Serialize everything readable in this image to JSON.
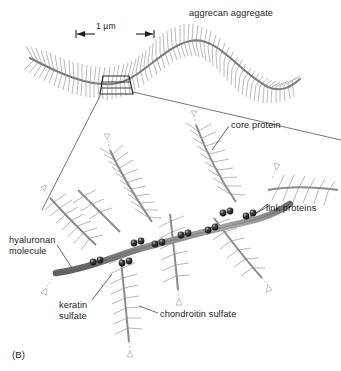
{
  "figure": {
    "panel_letter": "(B)",
    "title": "aggrecan aggregate",
    "scale_bar": {
      "label": "1 µm",
      "kind": "double-headed-arrow"
    },
    "labels": {
      "core_protein": "core protein",
      "link_proteins": "link proteins",
      "hyaluronan_molecule": "hyaluronan\nmolecule",
      "keratin_sulfate": "keratin\nsulfate",
      "chondroitin_sulfate": "chondroitin sulfate"
    },
    "colors": {
      "background": "#ffffff",
      "text": "#1d1d1d",
      "backbone": "#8d8d8d",
      "backbone_edge": "#5e5e5e",
      "bristle": "#9a9a9a",
      "bristle_dark": "#6f6f6f",
      "bead": "#141414",
      "bead_highlight": "#bdbdbd",
      "leader_line": "#3a3a3a",
      "box_stroke": "#2b2b2b",
      "arrow_tip": "#b5b5b5"
    }
  }
}
